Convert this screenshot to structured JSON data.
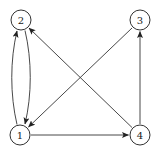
{
  "diagram": {
    "type": "directed-graph",
    "nodes": [
      {
        "id": "1",
        "label": "1",
        "x": 20,
        "y": 135
      },
      {
        "id": "2",
        "label": "2",
        "x": 21,
        "y": 20
      },
      {
        "id": "3",
        "label": "3",
        "x": 140,
        "y": 20
      },
      {
        "id": "4",
        "label": "4",
        "x": 140,
        "y": 135
      }
    ],
    "edges": [
      {
        "from": "1",
        "to": "2",
        "style": "curved-left"
      },
      {
        "from": "2",
        "to": "1",
        "style": "curved-right"
      },
      {
        "from": "4",
        "to": "2",
        "style": "straight"
      },
      {
        "from": "3",
        "to": "1",
        "style": "straight"
      },
      {
        "from": "1",
        "to": "4",
        "style": "straight"
      },
      {
        "from": "4",
        "to": "3",
        "style": "straight"
      }
    ],
    "colors": {
      "stroke": "#333333",
      "background": "#ffffff"
    }
  }
}
